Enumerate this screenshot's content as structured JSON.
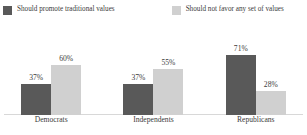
{
  "chart_data": {
    "type": "bar",
    "title": "",
    "subtitle": "",
    "xlabel": "",
    "ylabel": "",
    "ylim": [
      0,
      100
    ],
    "grid": false,
    "legend_position": "top-left",
    "value_suffix": "%",
    "categories": [
      "Democrats",
      "Independents",
      "Republicans"
    ],
    "series": [
      {
        "name": "Should promote traditional values",
        "color": "#595959",
        "values": [
          37,
          60,
          37
        ],
        "labels": [
          "37%",
          "37%",
          "71%"
        ]
      },
      {
        "name": "Should not favor any set of values",
        "color": "#d0d0d0",
        "values": [
          60,
          55,
          28
        ],
        "labels": [
          "60%",
          "55%",
          "28%"
        ]
      }
    ],
    "groups": [
      {
        "category": "Democrats",
        "bars": [
          {
            "series": "Should promote traditional values",
            "value": 37,
            "label": "37%"
          },
          {
            "series": "Should not favor any set of values",
            "value": 60,
            "label": "60%"
          }
        ]
      },
      {
        "category": "Independents",
        "bars": [
          {
            "series": "Should promote traditional values",
            "value": 37,
            "label": "37%"
          },
          {
            "series": "Should not favor any set of values",
            "value": 55,
            "label": "55%"
          }
        ]
      },
      {
        "category": "Republicans",
        "bars": [
          {
            "series": "Should promote traditional values",
            "value": 71,
            "label": "71%"
          },
          {
            "series": "Should not favor any set of values",
            "value": 28,
            "label": "28%"
          }
        ]
      }
    ]
  },
  "legend": {
    "items": [
      {
        "label": "Should promote traditional values",
        "color": "#595959"
      },
      {
        "label": "Should not favor any set of values",
        "color": "#d0d0d0"
      }
    ]
  },
  "axis": {
    "baseline_color": "#d8d8d8"
  }
}
